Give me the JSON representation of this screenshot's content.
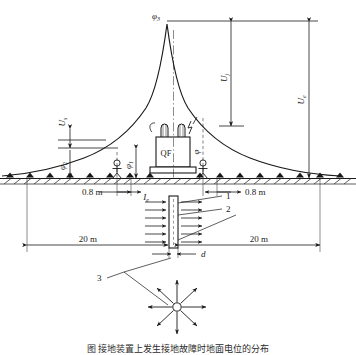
{
  "figure": {
    "title_caption": "图    接地装置上发生接地故障时地面电位的分布",
    "peak_label": "φ",
    "peak_sub": "3",
    "equipment_label": "QF"
  },
  "potential_labels": {
    "phi3": "φ",
    "phi3_sub": "3",
    "phi2": "φ",
    "phi2_sub": "2",
    "phi1": "φ",
    "phi1_sub": "1",
    "phi": "φ"
  },
  "voltage_labels": {
    "step_voltage": "U",
    "step_voltage_sub": "s",
    "touch_voltage": "U",
    "touch_voltage_sub": "j",
    "earth_voltage": "U",
    "earth_voltage_sub": "e"
  },
  "current_label": {
    "symbol": "I",
    "sub": "e"
  },
  "diameter_label": "d",
  "dimensions": {
    "left_step": "0.8 m",
    "right_step": "0.8 m",
    "left_span": "20 m",
    "right_span": "20 m"
  },
  "callouts": [
    {
      "id": "1",
      "label": "1"
    },
    {
      "id": "2",
      "label": "2"
    },
    {
      "id": "3",
      "label": "3"
    }
  ],
  "colors": {
    "line": "#1a1a1a",
    "background": "#ffffff",
    "hatch": "#333333"
  }
}
